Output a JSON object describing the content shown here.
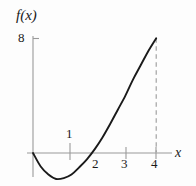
{
  "chart_data": {
    "type": "line",
    "title": "",
    "subtitle": "",
    "xlabel": "x",
    "ylabel": "f(x)",
    "xlim": [
      -0.15,
      4.55
    ],
    "ylim": [
      -2.6,
      9.2
    ],
    "grid": false,
    "legend": null,
    "x_ticks": [
      {
        "value": 1,
        "label": "1",
        "label_position": "above-axis"
      },
      {
        "value": 2,
        "label": "2",
        "label_position": "below-axis"
      },
      {
        "value": 3,
        "label": "3",
        "label_position": "below-axis"
      },
      {
        "value": 4,
        "label": "4",
        "label_position": "below-axis"
      }
    ],
    "y_ticks": [
      {
        "value": 8,
        "label": "8",
        "label_position": "left-of-axis"
      }
    ],
    "series": [
      {
        "name": "f(x)",
        "color": "#1a1a1a",
        "x": [
          0.0,
          0.25,
          0.5,
          0.75,
          1.0,
          1.25,
          1.5,
          1.75,
          2.0,
          2.25,
          2.5,
          2.75,
          3.0,
          3.25,
          3.5,
          3.75,
          4.0
        ],
        "y": [
          0.0,
          -0.94,
          -1.5,
          -1.81,
          -1.75,
          -1.5,
          -1.0,
          -0.44,
          0.25,
          1.06,
          2.0,
          3.0,
          4.0,
          5.13,
          6.13,
          7.13,
          8.0
        ]
      }
    ],
    "annotations": [
      {
        "type": "dashed-vertical-line",
        "name": "endpoint-dropline",
        "x": 4,
        "y_from": 0,
        "y_to": 8,
        "color": "#9a9a9a"
      }
    ],
    "axis_color": "#9a9a9a",
    "curve_color": "#1a1a1a",
    "background": "#fdfdfd"
  },
  "labels": {
    "y_axis": "f(x)",
    "x_axis": "x",
    "y_tick_8": "8",
    "x_tick_1": "1",
    "x_tick_2": "2",
    "x_tick_3": "3",
    "x_tick_4": "4"
  }
}
